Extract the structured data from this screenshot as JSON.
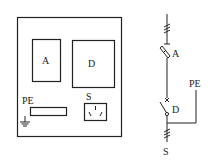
{
  "panel": {
    "labels": {
      "a_box": "A",
      "d_box": "D",
      "pe": "PE",
      "socket": "S"
    }
  },
  "schematic": {
    "labels": {
      "fuse": "A",
      "pe": "PE",
      "switch": "D",
      "socket": "S"
    }
  },
  "colors": {
    "stroke": "#222222",
    "background": "#ffffff"
  }
}
